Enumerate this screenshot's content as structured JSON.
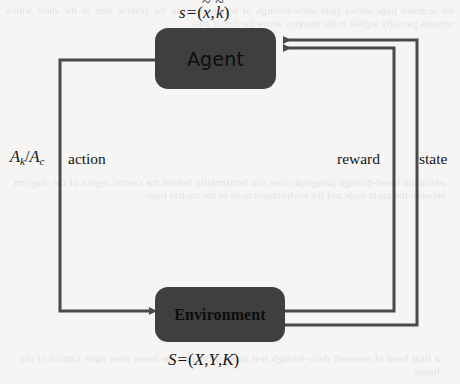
{
  "page": {
    "background_color": "#f6f5f3",
    "stroke_color": "#4a4a4c",
    "node_fill_color": "#3f3f3f",
    "text_color": "#17171a"
  },
  "diagram": {
    "type": "reinforcement-learning-loop",
    "nodes": [
      {
        "id": "agent",
        "label": "Agent"
      },
      {
        "id": "environment",
        "label": "Environment"
      }
    ],
    "formulas": {
      "agent_state": {
        "lhs": "s",
        "operator": "=",
        "open_paren": "(",
        "term1_base": "x",
        "term1_accent": "~",
        "comma": ",",
        "term2_base": "k",
        "term2_accent": "~",
        "close_paren": ")",
        "plain": "s = (x̃, k̃)"
      },
      "environment_state": {
        "lhs": "S",
        "operator": "=",
        "open_paren": "(",
        "term1": "X",
        "comma1": ",",
        "term2": "Y",
        "comma2": ",",
        "term3": "K",
        "close_paren": ")",
        "plain": "S = (X, Y, K)"
      }
    },
    "edges": [
      {
        "id": "action",
        "label": "action",
        "annotation_base1": "A",
        "annotation_sub1": "k",
        "annotation_slash": "/",
        "annotation_base2": "A",
        "annotation_sub2": "c",
        "annotation_plain": "A_k/A_c",
        "from": "agent",
        "to": "environment",
        "direction": "agent-to-environment"
      },
      {
        "id": "reward",
        "label": "reward",
        "from": "environment",
        "to": "agent",
        "direction": "environment-to-agent"
      },
      {
        "id": "state",
        "label": "state",
        "from": "environment",
        "to": "agent",
        "direction": "environment-to-agent"
      }
    ]
  },
  "ghost_text": {
    "top": "the scanned page shows faint show-through of text printed on the reverse side of the sheet which remains partially legible in the margins above the figure area",
    "middle": "additional bleed-through paragraph lines run horizontally behind the central region of the diagram between the agent node and the environment node of the control loop",
    "bottom": "a final band of reversed show-through text appears beneath the lower state tuple caption of the figure"
  }
}
